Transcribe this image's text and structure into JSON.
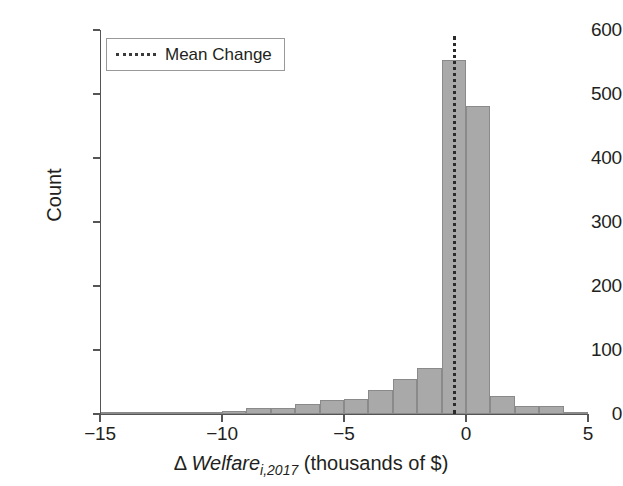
{
  "chart_data": {
    "type": "bar",
    "title": "",
    "subtitle": "",
    "xlabel_parts": {
      "delta": "Δ",
      "variable": "Welfare",
      "subscript": "i,2017",
      "units": "(thousands of $)"
    },
    "xlabel": "Δ Welfare_{i,2017} (thousands of $)",
    "ylabel": "Count",
    "xlim": [
      -15,
      5
    ],
    "ylim": [
      0,
      600
    ],
    "grid": false,
    "bin_width": 1,
    "bar_color": "#a9a9a9",
    "bar_edge_color": "#8a8a8a",
    "legend": {
      "position": "upper left",
      "entries": [
        {
          "label": "Mean Change",
          "style": "dotted-line",
          "color": "#3a3a3a"
        }
      ]
    },
    "annotations": [
      {
        "name": "mean-change-line",
        "type": "vline",
        "x": -0.55,
        "style": "dotted",
        "color": "#2b2b2b"
      }
    ],
    "xticks": [
      -15,
      -10,
      -5,
      0,
      5
    ],
    "xtick_labels": [
      "−15",
      "−10",
      "−5",
      "0",
      "5"
    ],
    "yticks": [
      0,
      100,
      200,
      300,
      400,
      500,
      600
    ],
    "ytick_labels": [
      "0",
      "100",
      "200",
      "300",
      "400",
      "500",
      "600"
    ],
    "bin_starts": [
      -15,
      -14,
      -13,
      -12,
      -11,
      -10,
      -9,
      -8,
      -7,
      -6,
      -5,
      -4,
      -3,
      -2,
      -1,
      0,
      1,
      2,
      3,
      4
    ],
    "categories": [
      "-15",
      "-14",
      "-13",
      "-12",
      "-11",
      "-10",
      "-9",
      "-8",
      "-7",
      "-6",
      "-5",
      "-4",
      "-3",
      "-2",
      "-1",
      "0",
      "1",
      "2",
      "3",
      "4"
    ],
    "values": [
      1,
      1,
      2,
      2,
      3,
      5,
      9,
      9,
      16,
      22,
      24,
      37,
      54,
      72,
      553,
      481,
      28,
      12,
      12,
      3
    ]
  }
}
